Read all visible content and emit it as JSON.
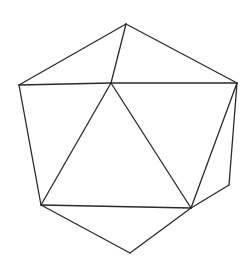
{
  "figure": {
    "stroke_color": "#2a2a2a",
    "background_color": "#ffffff",
    "vertices": {
      "top": [
        126,
        24
      ],
      "center": [
        111,
        83
      ],
      "left": [
        19,
        85
      ],
      "right": [
        237,
        83
      ],
      "bottom_left": [
        41,
        205
      ],
      "bottom_right": [
        191,
        208
      ],
      "right_lower": [
        229,
        185
      ],
      "bottom": [
        130,
        253
      ]
    },
    "edges": [
      [
        "left",
        "top"
      ],
      [
        "top",
        "right"
      ],
      [
        "top",
        "center"
      ],
      [
        "left",
        "center"
      ],
      [
        "center",
        "right"
      ],
      [
        "left",
        "bottom_left"
      ],
      [
        "center",
        "bottom_left"
      ],
      [
        "center",
        "bottom_right"
      ],
      [
        "right",
        "bottom_right"
      ],
      [
        "right",
        "right_lower"
      ],
      [
        "right_lower",
        "bottom_right"
      ],
      [
        "bottom_left",
        "bottom_right"
      ],
      [
        "bottom_left",
        "bottom"
      ],
      [
        "bottom",
        "bottom_right"
      ]
    ]
  }
}
